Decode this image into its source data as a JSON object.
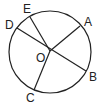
{
  "diagram": {
    "type": "circle-geometry",
    "circle": {
      "cx": 50,
      "cy": 52,
      "r": 41
    },
    "center": {
      "label": "O",
      "x": 50,
      "y": 51,
      "label_x": 36,
      "label_y": 62
    },
    "points": [
      {
        "label": "A",
        "x": 80,
        "y": 26,
        "label_x": 84,
        "label_y": 26
      },
      {
        "label": "B",
        "x": 86,
        "y": 71,
        "label_x": 89,
        "label_y": 81
      },
      {
        "label": "C",
        "x": 34,
        "y": 90,
        "label_x": 26,
        "label_y": 102
      },
      {
        "label": "D",
        "x": 17,
        "y": 28,
        "label_x": 5,
        "label_y": 29
      },
      {
        "label": "E",
        "x": 30,
        "y": 17,
        "label_x": 23,
        "label_y": 13
      }
    ],
    "segments": [
      {
        "from": "D",
        "to": "B",
        "kind": "diameter"
      },
      {
        "from": "O",
        "to": "A",
        "kind": "radius"
      },
      {
        "from": "O",
        "to": "C",
        "kind": "radius"
      },
      {
        "from": "O",
        "to": "E",
        "kind": "radius"
      }
    ],
    "stroke_color": "#222222"
  }
}
